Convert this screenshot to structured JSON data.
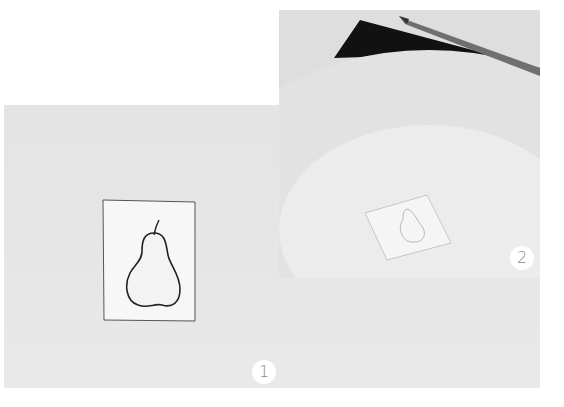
{
  "photos": [
    {
      "id": "photo1",
      "description": "Pencil line drawing of a pear on a small white card lying on a light gray surface",
      "badge": "1"
    },
    {
      "id": "photo2",
      "description": "Small pear drawing card placed on a large white plate, with a black sheet and a pencil at the top",
      "badge": "2"
    }
  ],
  "colors": {
    "background": "#ffffff",
    "surface_gray": "#e6e6e6",
    "plate": "#eeeeee",
    "plate_rim": "#e2e2e2",
    "dark_sheet": "#111111",
    "badge_bg": "#ffffff",
    "badge_text": "#8a8a8a"
  }
}
